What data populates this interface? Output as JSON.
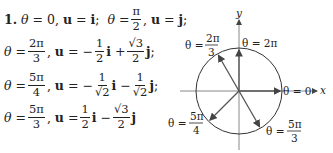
{
  "problem_number": "1.",
  "equations": [
    {
      "theta": "0",
      "u": "i",
      "theta2": "π/2",
      "u2": "j"
    },
    {
      "theta_num": "2π",
      "theta_den": "3",
      "u_a_sign": "−",
      "u_a_num": "1",
      "u_a_den": "2",
      "u_b_sign": "+",
      "u_b_num": "√3",
      "u_b_den": "2"
    },
    {
      "theta_num": "5π",
      "theta_den": "4",
      "u_a_sign": "−",
      "u_a_num": "1",
      "u_a_den": "√2",
      "u_b_sign": "−",
      "u_b_num": "1",
      "u_b_den": "√2"
    },
    {
      "theta_num": "5π",
      "theta_den": "3",
      "u_a_sign": "",
      "u_a_num": "1",
      "u_a_den": "2",
      "u_b_sign": "−",
      "u_b_num": "√3",
      "u_b_den": "2"
    }
  ],
  "symbols": {
    "theta": "θ",
    "u": "u",
    "i": "i",
    "j": "j",
    "eq": "=",
    "comma": ",",
    "semicolon": ";"
  },
  "figure": {
    "x_axis_label": "x",
    "y_axis_label": "y",
    "labels": {
      "theta0": "θ = 0",
      "theta2pi": "θ = 2π",
      "theta2pi3_prefix": "θ =",
      "theta2pi3_num": "2π",
      "theta2pi3_den": "3",
      "theta5pi4_prefix": "θ =",
      "theta5pi4_num": "5π",
      "theta5pi4_den": "4",
      "theta5pi3_prefix": "θ =",
      "theta5pi3_num": "5π",
      "theta5pi3_den": "3"
    },
    "colors": {
      "axis": "#888888",
      "circle": "#333333",
      "vector": "#555555"
    }
  }
}
